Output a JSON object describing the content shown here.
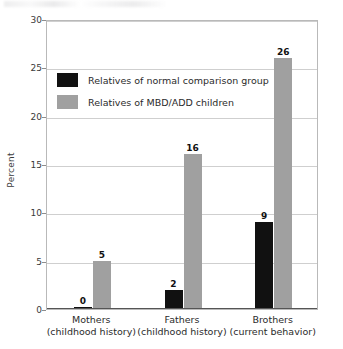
{
  "chart_data": {
    "type": "bar",
    "title": "",
    "xlabel": "",
    "ylabel": "Percent",
    "ylim": [
      0,
      30
    ],
    "yticks": [
      0,
      5,
      10,
      15,
      20,
      25,
      30
    ],
    "ytick_labels": [
      "0",
      "5",
      "10",
      "15",
      "20",
      "25",
      "30"
    ],
    "grid": true,
    "legend_position": "upper-left-inside",
    "categories": [
      "Mothers",
      "Fathers",
      "Brothers"
    ],
    "category_sublabels": [
      "(childhood history)",
      "(childhood history)",
      "(current behavior)"
    ],
    "series": [
      {
        "name": "Relatives of normal comparison group",
        "color": "#111111",
        "values": [
          0,
          2,
          9
        ],
        "value_labels": [
          "0",
          "2",
          "9"
        ]
      },
      {
        "name": "Relatives of MBD/ADD children",
        "color": "#a0a0a0",
        "values": [
          5,
          16,
          26
        ],
        "value_labels": [
          "5",
          "16",
          "26"
        ]
      }
    ]
  },
  "axis": {
    "y_label": "Percent"
  },
  "legend": {
    "items": [
      {
        "label": "Relatives of normal comparison group",
        "color": "#111111"
      },
      {
        "label": "Relatives of MBD/ADD children",
        "color": "#a0a0a0"
      }
    ]
  }
}
